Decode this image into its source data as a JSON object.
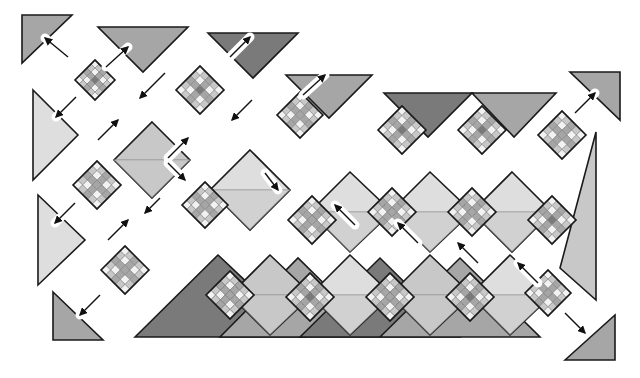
{
  "diagram": {
    "title": "Quilt assembly diagram - diagonal rows with setting triangles",
    "type": "quilt-assembly",
    "colors": {
      "background": "#ffffff",
      "outline": "#1a1a1a",
      "dark": "#7a7a7a",
      "medium": "#a6a6a6",
      "light": "#c8c8c8",
      "pale": "#dedede",
      "white": "#f2f2f2",
      "arrow": "#111111",
      "arrow_halo": "#ffffff"
    },
    "block_size": 60,
    "blocks": [
      {
        "id": "b1",
        "cx": 95,
        "cy": 80,
        "s": 40,
        "center": "dark"
      },
      {
        "id": "b2",
        "cx": 200,
        "cy": 90,
        "s": 48,
        "center": "dark"
      },
      {
        "id": "b3",
        "cx": 97,
        "cy": 185,
        "s": 48,
        "center": "medium"
      },
      {
        "id": "b4",
        "cx": 125,
        "cy": 270,
        "s": 48,
        "center": "medium"
      },
      {
        "id": "b5",
        "cx": 300,
        "cy": 115,
        "s": 46,
        "center": "medium"
      },
      {
        "id": "b6",
        "cx": 205,
        "cy": 205,
        "s": 46,
        "center": "medium"
      },
      {
        "id": "b7",
        "cx": 402,
        "cy": 130,
        "s": 48,
        "center": "dark"
      },
      {
        "id": "b8",
        "cx": 482,
        "cy": 130,
        "s": 48,
        "center": "dark"
      },
      {
        "id": "b9",
        "cx": 562,
        "cy": 135,
        "s": 48,
        "center": "medium"
      },
      {
        "id": "b10",
        "cx": 312,
        "cy": 220,
        "s": 48,
        "center": "medium"
      },
      {
        "id": "b11",
        "cx": 392,
        "cy": 212,
        "s": 48,
        "center": "medium"
      },
      {
        "id": "b12",
        "cx": 472,
        "cy": 212,
        "s": 48,
        "center": "medium"
      },
      {
        "id": "b13",
        "cx": 552,
        "cy": 220,
        "s": 48,
        "center": "dark"
      },
      {
        "id": "b14",
        "cx": 230,
        "cy": 295,
        "s": 48,
        "center": "medium"
      },
      {
        "id": "b15",
        "cx": 310,
        "cy": 297,
        "s": 48,
        "center": "dark"
      },
      {
        "id": "b16",
        "cx": 390,
        "cy": 297,
        "s": 48,
        "center": "medium"
      },
      {
        "id": "b17",
        "cx": 470,
        "cy": 297,
        "s": 48,
        "center": "dark"
      },
      {
        "id": "b18",
        "cx": 548,
        "cy": 293,
        "s": 46,
        "center": "medium"
      }
    ],
    "plain_squares": [
      {
        "id": "p1",
        "points": "152,122 190,160 152,198 114,160",
        "fill": "light",
        "split": "h"
      },
      {
        "id": "p2",
        "points": "250,150 290,190 250,230 210,190",
        "fill": "pale",
        "split": "h"
      },
      {
        "id": "p3",
        "points": "350,172 392,212 350,252 310,212",
        "fill": "pale",
        "split": "h"
      },
      {
        "id": "p4",
        "points": "430,172 472,212 430,252 390,212",
        "fill": "pale",
        "split": "h"
      },
      {
        "id": "p5",
        "points": "512,172 552,212 512,252 472,212",
        "fill": "pale",
        "split": "h"
      },
      {
        "id": "p6",
        "points": "270,255 312,295 270,335 230,295",
        "fill": "light",
        "split": "h"
      },
      {
        "id": "p7",
        "points": "350,255 392,295 350,335 310,295",
        "fill": "pale",
        "split": "h"
      },
      {
        "id": "p8",
        "points": "430,255 472,295 430,335 390,295",
        "fill": "light",
        "split": "h"
      },
      {
        "id": "p9",
        "points": "510,255 552,295 510,335 470,295",
        "fill": "pale",
        "split": "h"
      }
    ],
    "setting_triangles": [
      {
        "id": "t1",
        "points": "22,15 72,15 22,63",
        "fill": "medium"
      },
      {
        "id": "t2",
        "points": "98,27 188,27 143,72",
        "fill": "medium"
      },
      {
        "id": "t3",
        "points": "208,33 298,33 253,78",
        "fill": "dark"
      },
      {
        "id": "t4",
        "points": "286,75 372,75 329,118",
        "fill": "medium"
      },
      {
        "id": "t5",
        "points": "33,90 78,135 33,180",
        "fill": "pale"
      },
      {
        "id": "t6",
        "points": "38,195 85,240 38,285",
        "fill": "pale"
      },
      {
        "id": "t7",
        "points": "53,292 103,340 53,340",
        "fill": "medium"
      },
      {
        "id": "t8",
        "points": "384,93 472,93 428,137",
        "fill": "dark"
      },
      {
        "id": "t9",
        "points": "472,93 556,93 514,137",
        "fill": "medium"
      },
      {
        "id": "t10",
        "points": "570,72 620,72 620,120",
        "fill": "medium"
      },
      {
        "id": "t11",
        "points": "596,132 596,300 560,268",
        "fill": "light"
      },
      {
        "id": "t12",
        "points": "135,337 218,255 305,337",
        "fill": "dark"
      },
      {
        "id": "t13",
        "points": "220,337 298,258 378,337",
        "fill": "medium"
      },
      {
        "id": "t14",
        "points": "300,337 380,258 460,337",
        "fill": "dark"
      },
      {
        "id": "t15",
        "points": "380,337 460,258 540,337",
        "fill": "medium"
      },
      {
        "id": "t16",
        "points": "565,360 615,315 615,360",
        "fill": "medium"
      }
    ],
    "arrows": [
      {
        "x1": 68,
        "y1": 57,
        "x2": 45,
        "y2": 38
      },
      {
        "x1": 106,
        "y1": 67,
        "x2": 128,
        "y2": 47
      },
      {
        "x1": 76,
        "y1": 97,
        "x2": 56,
        "y2": 117
      },
      {
        "x1": 230,
        "y1": 57,
        "x2": 250,
        "y2": 37
      },
      {
        "x1": 165,
        "y1": 73,
        "x2": 140,
        "y2": 98
      },
      {
        "x1": 98,
        "y1": 140,
        "x2": 118,
        "y2": 120
      },
      {
        "x1": 252,
        "y1": 100,
        "x2": 232,
        "y2": 120
      },
      {
        "x1": 303,
        "y1": 95,
        "x2": 325,
        "y2": 75
      },
      {
        "x1": 168,
        "y1": 158,
        "x2": 188,
        "y2": 138
      },
      {
        "x1": 168,
        "y1": 163,
        "x2": 185,
        "y2": 180
      },
      {
        "x1": 75,
        "y1": 203,
        "x2": 55,
        "y2": 223
      },
      {
        "x1": 108,
        "y1": 240,
        "x2": 128,
        "y2": 220
      },
      {
        "x1": 160,
        "y1": 198,
        "x2": 145,
        "y2": 213
      },
      {
        "x1": 265,
        "y1": 173,
        "x2": 278,
        "y2": 190
      },
      {
        "x1": 100,
        "y1": 295,
        "x2": 80,
        "y2": 315
      },
      {
        "x1": 355,
        "y1": 225,
        "x2": 335,
        "y2": 205
      },
      {
        "x1": 418,
        "y1": 243,
        "x2": 398,
        "y2": 223
      },
      {
        "x1": 478,
        "y1": 263,
        "x2": 458,
        "y2": 243
      },
      {
        "x1": 538,
        "y1": 283,
        "x2": 518,
        "y2": 263
      },
      {
        "x1": 575,
        "y1": 113,
        "x2": 595,
        "y2": 93
      },
      {
        "x1": 565,
        "y1": 313,
        "x2": 585,
        "y2": 333
      }
    ],
    "row_gaps": [
      {
        "points": "130,345 375,80 398,80 153,345"
      }
    ]
  }
}
